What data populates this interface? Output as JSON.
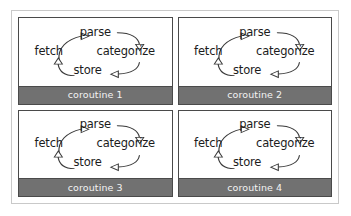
{
  "figure": {
    "panel_count": 4,
    "border_color": "#c9c9c9",
    "panel_border_color": "#4a4a4a",
    "footer_color": "#717171",
    "footer_text_color": "#f3f3f3",
    "node_text_color": "#1c1c1c",
    "background_color": "#ffffff"
  },
  "pipeline": {
    "nodes": {
      "fetch": "fetch",
      "parse": "parse",
      "categorize": "categorize",
      "store": "store"
    },
    "edges": [
      {
        "from": "fetch",
        "to": "parse",
        "arrow": "right"
      },
      {
        "from": "parse",
        "to": "categorize",
        "arrow": "down"
      },
      {
        "from": "categorize",
        "to": "store",
        "arrow": "left"
      },
      {
        "from": "store",
        "to": "fetch",
        "arrow": "up"
      }
    ]
  },
  "panels": [
    {
      "id": "coroutine-1",
      "label": "coroutine 1"
    },
    {
      "id": "coroutine-2",
      "label": "coroutine 2"
    },
    {
      "id": "coroutine-3",
      "label": "coroutine 3"
    },
    {
      "id": "coroutine-4",
      "label": "coroutine 4"
    }
  ]
}
